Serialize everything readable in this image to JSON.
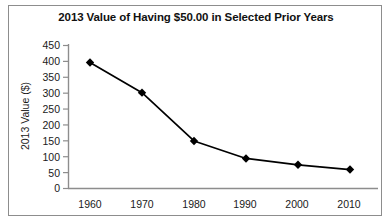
{
  "chart_data": {
    "type": "line",
    "title": "2013 Value of Having $50.00 in Selected Prior Years",
    "xlabel": "",
    "ylabel": "2013 Value ($)",
    "x": [
      1960,
      1970,
      1980,
      1990,
      2000,
      2010
    ],
    "categories": [
      "1960",
      "1970",
      "1980",
      "1990",
      "2000",
      "2010"
    ],
    "values": [
      395,
      300,
      148,
      93,
      73,
      58
    ],
    "series": [
      {
        "name": "2013 Value ($)",
        "values": [
          395,
          300,
          148,
          93,
          73,
          58
        ]
      }
    ],
    "ylim": [
      0,
      450
    ],
    "ytick_values": [
      450,
      400,
      350,
      300,
      250,
      200,
      150,
      100,
      50,
      0
    ],
    "ytick_labels": [
      "450",
      "400",
      "350",
      "300",
      "250",
      "200",
      "150",
      "100",
      "50",
      "0"
    ],
    "xtick_labels": [
      "1960",
      "1970",
      "1980",
      "1990",
      "2000",
      "2010"
    ],
    "grid": false,
    "legend": false,
    "marker": "diamond",
    "line_color": "#000000",
    "marker_color": "#000000",
    "axis_color": "#8d8d8d",
    "background_color": "#ffffff"
  }
}
